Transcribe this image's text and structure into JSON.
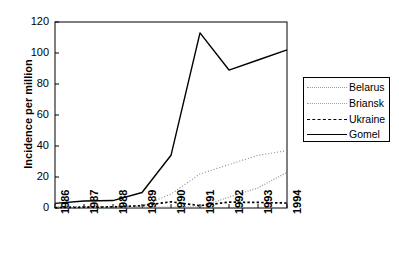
{
  "chart_data": {
    "type": "line",
    "title": "",
    "xlabel": "",
    "ylabel": "Incidence per million",
    "x": [
      1986,
      1987,
      1988,
      1989,
      1990,
      1991,
      1992,
      1993,
      1994
    ],
    "categories": [
      "1986",
      "1987",
      "1988",
      "1989",
      "1990",
      "1991",
      "1992",
      "1993",
      "1994"
    ],
    "xlim": [
      1986,
      1994
    ],
    "ylim": [
      0,
      120
    ],
    "yticks": [
      0,
      20,
      40,
      60,
      80,
      100,
      120
    ],
    "ytick_labels": [
      "0",
      "20",
      "40",
      "60",
      "80",
      "100",
      "120"
    ],
    "grid": false,
    "legend_position": "right-outside",
    "series": [
      {
        "name": "Belarus",
        "style": "dotted-fine",
        "color": "#888888",
        "values": [
          0.8,
          0.9,
          1.0,
          1.2,
          9.0,
          22.0,
          28.0,
          34.0,
          37.0
        ]
      },
      {
        "name": "Briansk",
        "style": "dotted-dense",
        "color": "#999999",
        "values": [
          0.2,
          0.3,
          0.4,
          0.5,
          0.6,
          0.8,
          7.0,
          13.0,
          23.0
        ]
      },
      {
        "name": "Ukraine",
        "style": "dashed-coarse",
        "color": "#000000",
        "values": [
          0.3,
          0.5,
          0.7,
          1.5,
          4.0,
          1.5,
          3.8,
          3.6,
          3.2
        ]
      },
      {
        "name": "Gomel",
        "style": "solid",
        "color": "#000000",
        "values": [
          3.0,
          4.5,
          4.8,
          10.0,
          34.0,
          113.0,
          89.0,
          95.5,
          102.0
        ]
      }
    ]
  },
  "axes": {
    "ylabel": "Incidence per million",
    "ytick_labels": [
      "120",
      "100",
      "80",
      "60",
      "40",
      "20",
      "0"
    ],
    "xtick_labels": [
      "1986",
      "1987",
      "1988",
      "1989",
      "1990",
      "1991",
      "1992",
      "1993",
      "1994"
    ]
  },
  "legend": {
    "entries": [
      {
        "label": "Belarus"
      },
      {
        "label": "Briansk"
      },
      {
        "label": "Ukraine"
      },
      {
        "label": "Gomel"
      }
    ]
  }
}
